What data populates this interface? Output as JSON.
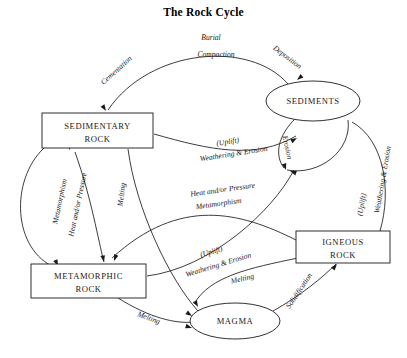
{
  "title": "The Rock Cycle",
  "nodes": [
    {
      "id": "sedimentary",
      "label_line1": "SEDIMENTARY",
      "label_line2": "ROCK",
      "shape": "rect",
      "x": 42,
      "y": 113,
      "w": 111,
      "h": 35
    },
    {
      "id": "sediments",
      "label_line1": "SEDIMENTS",
      "label_line2": "",
      "shape": "ellipse",
      "cx": 313,
      "cy": 101,
      "rx": 47,
      "ry": 20
    },
    {
      "id": "metamorphic",
      "label_line1": "METAMORPHIC",
      "label_line2": "ROCK",
      "shape": "rect",
      "x": 31,
      "y": 264,
      "w": 115,
      "h": 34
    },
    {
      "id": "igneous",
      "label_line1": "IGNEOUS",
      "label_line2": "ROCK",
      "shape": "rect",
      "x": 296,
      "y": 231,
      "w": 94,
      "h": 32
    },
    {
      "id": "magma",
      "label_line1": "MAGMA",
      "label_line2": "",
      "shape": "ellipse",
      "cx": 235,
      "cy": 321,
      "rx": 45,
      "ry": 18
    }
  ],
  "edge_labels": [
    {
      "id": "cementation",
      "text": "Cementation",
      "x": 118,
      "y": 72,
      "rotate": -42
    },
    {
      "id": "burial",
      "text": "Burial",
      "x": 211,
      "y": 40,
      "rotate": 0
    },
    {
      "id": "compaction",
      "text": "Compaction",
      "x": 216,
      "y": 57,
      "rotate": 0
    },
    {
      "id": "deposition",
      "text": "Deposition",
      "x": 286,
      "y": 59,
      "rotate": 37
    },
    {
      "id": "erosion-sediments",
      "text": "Erosion",
      "x": 285,
      "y": 148,
      "rotate": 78
    },
    {
      "id": "uplift-upper",
      "text": "(Uplift)",
      "x": 228,
      "y": 144,
      "rotate": -9
    },
    {
      "id": "weathering-erosion-upper",
      "text": "Weathering & Erosion",
      "x": 234,
      "y": 156,
      "rotate": -9
    },
    {
      "id": "heat-pressure-mid",
      "text": "Heat and/or Pressure",
      "x": 223,
      "y": 192,
      "rotate": -8
    },
    {
      "id": "metamorphism-mid",
      "text": "Metamorphism",
      "x": 219,
      "y": 206,
      "rotate": -8
    },
    {
      "id": "heat-pressure-left",
      "text": "Heat and/or Pressure",
      "x": 80,
      "y": 205,
      "rotate": -78
    },
    {
      "id": "metamorphism-left",
      "text": "Metamorphism",
      "x": 62,
      "y": 202,
      "rotate": -78
    },
    {
      "id": "melting-sedimentary",
      "text": "Melting",
      "x": 124,
      "y": 195,
      "rotate": -82
    },
    {
      "id": "uplift-lower",
      "text": "(Uplift)",
      "x": 212,
      "y": 254,
      "rotate": -17
    },
    {
      "id": "weathering-erosion-lower",
      "text": "Weathering & Erosion",
      "x": 219,
      "y": 267,
      "rotate": -17
    },
    {
      "id": "weathering-erosion-right",
      "text": "Weathering & Erosion",
      "x": 385,
      "y": 180,
      "rotate": -80
    },
    {
      "id": "uplift-right",
      "text": "(Uplift)",
      "x": 364,
      "y": 205,
      "rotate": -80
    },
    {
      "id": "melting-igneous",
      "text": "Melting",
      "x": 243,
      "y": 281,
      "rotate": -14
    },
    {
      "id": "melting-metamorphic",
      "text": "Melting",
      "x": 148,
      "y": 320,
      "rotate": 20
    },
    {
      "id": "solidification",
      "text": "Solidification",
      "x": 301,
      "y": 292,
      "rotate": -56
    }
  ],
  "edges": [
    {
      "id": "sediments-to-sedimentary",
      "from": "sediments",
      "to": "sedimentary",
      "path": "M 288 84 C 250 40, 150 48, 108 110"
    },
    {
      "id": "sedimentary-to-sediments",
      "from": "sedimentary",
      "to": "sediments",
      "path": "M 154 134 C 210 150, 255 160, 296 136"
    },
    {
      "id": "sediments-self-erosion",
      "from": "sediments",
      "to": "sediments",
      "path": "M 296 118 C 278 135, 274 155, 284 168"
    },
    {
      "id": "sediments-loop-right",
      "from": "sediments",
      "to": "sediments",
      "path": "M 287 170 C 320 176, 352 150, 348 120"
    },
    {
      "id": "sedimentary-to-metamorphic-left",
      "from": "sedimentary",
      "to": "metamorphic",
      "path": "M 44 148 C 10 180, 12 250, 56 268"
    },
    {
      "id": "sedimentary-to-metamorphic-inner",
      "from": "sedimentary",
      "to": "metamorphic",
      "path": "M 75 152 C 92 200, 98 240, 104 262"
    },
    {
      "id": "sedimentary-to-magma",
      "from": "sedimentary",
      "to": "magma",
      "path": "M 128 149 C 136 210, 170 280, 198 311"
    },
    {
      "id": "igneous-to-metamorphic",
      "from": "igneous",
      "to": "metamorphic",
      "path": "M 296 240 C 240 212, 180 196, 112 258"
    },
    {
      "id": "metamorphic-to-magma",
      "from": "metamorphic",
      "to": "magma",
      "path": "M 118 298 C 150 318, 176 324, 194 322"
    },
    {
      "id": "igneous-to-magma",
      "from": "igneous",
      "to": "magma",
      "path": "M 298 258 C 250 268, 210 276, 194 304"
    },
    {
      "id": "magma-to-igneous",
      "from": "magma",
      "to": "igneous",
      "path": "M 273 311 C 300 296, 322 278, 336 264"
    },
    {
      "id": "igneous-to-sediments",
      "from": "igneous",
      "to": "sediments",
      "path": "M 380 231 C 392 190, 384 140, 352 122"
    },
    {
      "id": "metamorphic-to-sediments",
      "from": "metamorphic",
      "to": "sediments",
      "path": "M 147 276 C 210 268, 272 212, 294 170"
    }
  ],
  "arrowheads": [
    {
      "id": "arrow-into-sedimentary-top",
      "x": 106,
      "y": 111,
      "rotate": 58
    },
    {
      "id": "arrow-into-sediments-top",
      "x": 297,
      "y": 80,
      "rotate": 140
    },
    {
      "id": "arrow-into-sediments-left",
      "x": 297,
      "y": 138,
      "rotate": 330
    },
    {
      "id": "arrow-into-sediments-erosion",
      "x": 286,
      "y": 170,
      "rotate": 72
    },
    {
      "id": "arrow-into-sediments-right",
      "x": 290,
      "y": 171,
      "rotate": 200
    },
    {
      "id": "arrow-into-metamorphic-left",
      "x": 58,
      "y": 266,
      "rotate": 66
    },
    {
      "id": "arrow-into-metamorphic-inner",
      "x": 104,
      "y": 262,
      "rotate": 78
    },
    {
      "id": "arrow-into-metamorphic-right",
      "x": 114,
      "y": 261,
      "rotate": 110
    },
    {
      "id": "arrow-into-magma-top",
      "x": 198,
      "y": 307,
      "rotate": 62
    },
    {
      "id": "arrow-into-magma-left-upper",
      "x": 192,
      "y": 316,
      "rotate": 35
    },
    {
      "id": "arrow-into-magma-left-lower",
      "x": 192,
      "y": 328,
      "rotate": 18
    },
    {
      "id": "arrow-into-igneous-bottom",
      "x": 337,
      "y": 264,
      "rotate": -50
    },
    {
      "id": "arrow-into-sedimentary-head2",
      "x": 70,
      "y": 150,
      "rotate": 74
    }
  ]
}
